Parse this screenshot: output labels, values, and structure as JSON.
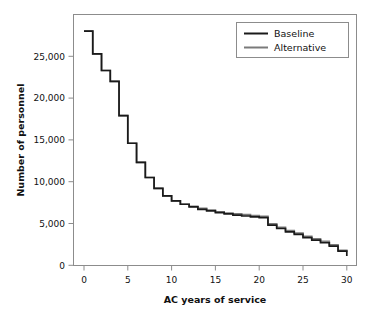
{
  "chart_data": {
    "type": "line",
    "title": "",
    "xlabel": "AC years of service",
    "ylabel": "Number of personnel",
    "xlim": [
      0,
      30
    ],
    "ylim": [
      0,
      28000
    ],
    "xticks": [
      0,
      5,
      10,
      15,
      20,
      25,
      30
    ],
    "xticklabels": [
      "0",
      "5",
      "10",
      "15",
      "20",
      "25",
      "30"
    ],
    "yticks": [
      0,
      5000,
      10000,
      15000,
      20000,
      25000
    ],
    "yticklabels": [
      "0",
      "5,000",
      "10,000",
      "15,000",
      "20,000",
      "25,000"
    ],
    "grid": false,
    "drawstyle": "steps-post",
    "legend_position": "upper right",
    "legend_entries": [
      "Baseline",
      "Alternative"
    ],
    "x": [
      0,
      1,
      2,
      3,
      4,
      5,
      6,
      7,
      8,
      9,
      10,
      11,
      12,
      13,
      14,
      15,
      16,
      17,
      18,
      19,
      20,
      21,
      22,
      23,
      24,
      25,
      26,
      27,
      28,
      29,
      30
    ],
    "series": [
      {
        "name": "Baseline",
        "color": "#1a1a1a",
        "values": [
          28000,
          25300,
          23300,
          22000,
          17900,
          14600,
          12300,
          10500,
          9200,
          8300,
          7700,
          7300,
          7000,
          6700,
          6500,
          6300,
          6150,
          6000,
          5900,
          5800,
          5700,
          4800,
          4400,
          4000,
          3700,
          3300,
          3000,
          2700,
          2300,
          1700,
          1100
        ]
      },
      {
        "name": "Alternative",
        "color": "#7a7a7a",
        "values": [
          28000,
          25300,
          23300,
          22000,
          17900,
          14600,
          12300,
          10500,
          9200,
          8300,
          7700,
          7300,
          7050,
          6800,
          6600,
          6400,
          6250,
          6150,
          6050,
          5950,
          5850,
          4950,
          4550,
          4150,
          3850,
          3450,
          3150,
          2850,
          2450,
          1800,
          1600
        ]
      }
    ]
  }
}
